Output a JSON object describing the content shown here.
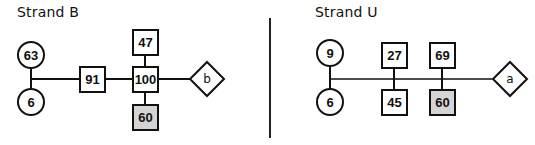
{
  "colors": {
    "stroke": "#111111",
    "highlight_fill": "#d4d4d4",
    "fill": "#ffffff"
  },
  "panels": [
    {
      "title": "Strand B",
      "circles": [
        {
          "label": "63"
        },
        {
          "label": "6"
        }
      ],
      "boxes": [
        {
          "label": "91",
          "highlighted": false
        },
        {
          "label": "47",
          "highlighted": false
        },
        {
          "label": "100",
          "highlighted": false
        },
        {
          "label": "60",
          "highlighted": true
        }
      ],
      "terminal": {
        "shape": "diamond",
        "label": "b"
      }
    },
    {
      "title": "Strand U",
      "circles": [
        {
          "label": "9"
        },
        {
          "label": "6"
        }
      ],
      "boxes": [
        {
          "label": "27",
          "highlighted": false
        },
        {
          "label": "45",
          "highlighted": false
        },
        {
          "label": "69",
          "highlighted": false
        },
        {
          "label": "60",
          "highlighted": true
        }
      ],
      "terminal": {
        "shape": "diamond",
        "label": "a"
      }
    }
  ]
}
